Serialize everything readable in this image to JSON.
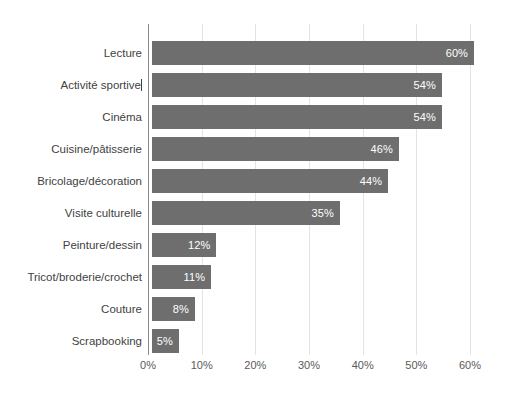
{
  "chart_data": {
    "type": "bar",
    "orientation": "horizontal",
    "title": "",
    "xlabel": "",
    "ylabel": "",
    "xlim": [
      0,
      60
    ],
    "grid": true,
    "legend": false,
    "legend_position": "none",
    "bar_color": "#6e6e6e",
    "value_label_color": "#ffffff",
    "gridline_color": "#e3e3e3",
    "axis_color": "#8a8a8a",
    "categories": [
      "Lecture",
      "Activité sportive",
      "Cinéma",
      "Cuisine/pâtisserie",
      "Bricolage/décoration",
      "Visite culturelle",
      "Peinture/dessin",
      "Tricot/broderie/crochet",
      "Couture",
      "Scrapbooking"
    ],
    "values": [
      60,
      54,
      54,
      46,
      44,
      35,
      12,
      11,
      8,
      5
    ],
    "value_labels": [
      "60%",
      "54%",
      "54%",
      "46%",
      "44%",
      "35%",
      "12%",
      "11%",
      "8%",
      "5%"
    ],
    "xticks": [
      0,
      10,
      20,
      30,
      40,
      50,
      60
    ],
    "xtick_labels": [
      "0%",
      "10%",
      "20%",
      "30%",
      "40%",
      "50%",
      "60%"
    ]
  },
  "artifacts": {
    "text_caret_after_category_index": 1
  }
}
